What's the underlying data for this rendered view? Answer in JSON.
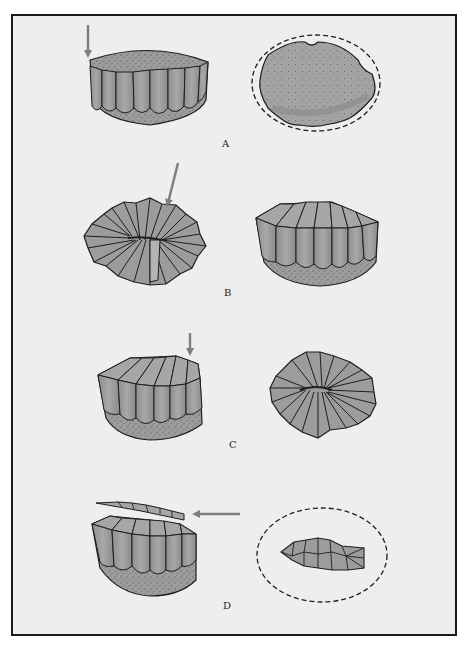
{
  "figure": {
    "panels": [
      {
        "id": "A",
        "label": "A",
        "left": "sandstone block with vertical columnar ribs, arrow pointing down at top-left edge",
        "right": "top view: stippled oval surface, dashed outline showing removed edges"
      },
      {
        "id": "B",
        "label": "B",
        "left": "top view: radiating ribbed star/rosette, arrow pointing at upper-right",
        "right": "block with ribbed top and columnar sides, stippled base"
      },
      {
        "id": "C",
        "label": "C",
        "left": "block with ribbed top, arrow pointing down at right edge",
        "right": "top view: radiating ribbed rosette"
      },
      {
        "id": "D",
        "label": "D",
        "left": "block with thin top slice detached, arrow pointing left at slice",
        "right": "top view: small ribbed lens within dashed oval outline"
      }
    ]
  },
  "colors": {
    "page": "#ffffff",
    "panel": "#eeeeee",
    "frame": "#1a1a1a",
    "fill": "#9c9c9c",
    "fill_dark": "#858585",
    "fill_light": "#b4b4b4",
    "outline": "#1e1e1e",
    "arrow": "#7e7e7e"
  }
}
